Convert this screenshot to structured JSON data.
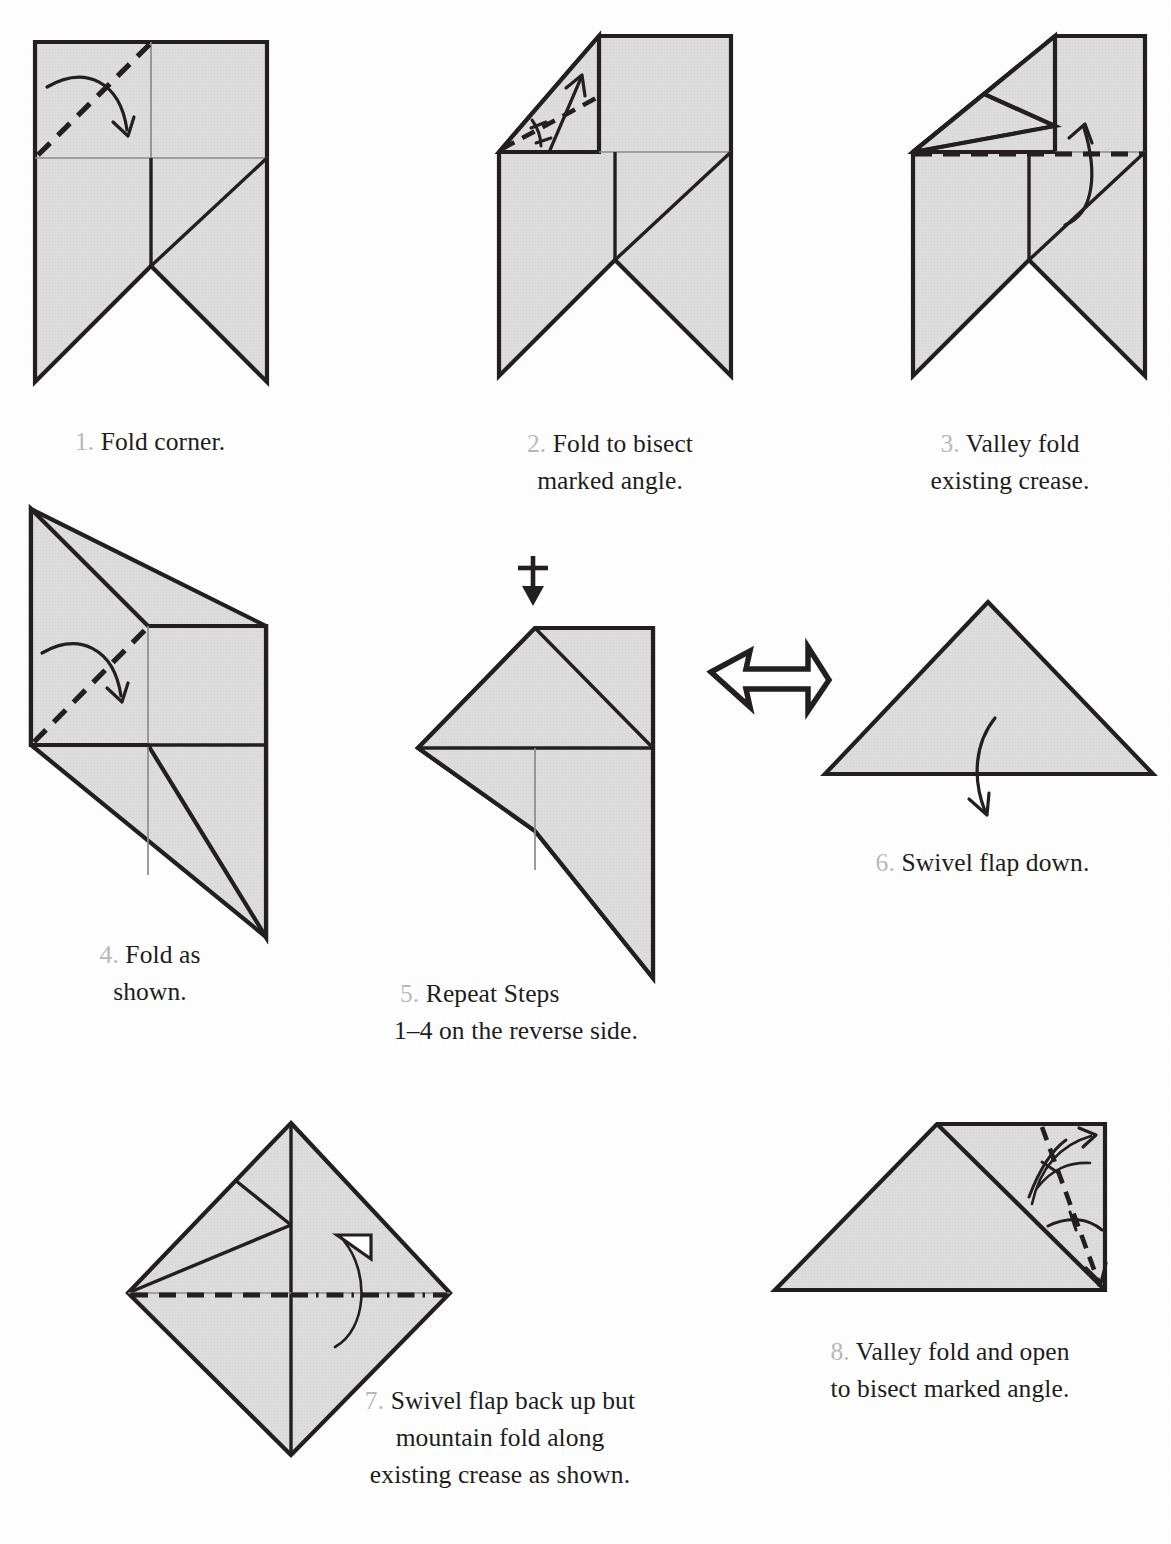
{
  "document": {
    "kind": "origami-folding-instructions",
    "fold_colors": {
      "paper_fill": "#dcdcdc",
      "edge_stroke": "#231f20",
      "crease_gray": "#8c8c8c",
      "step_number_gray": "#b9b9b9"
    }
  },
  "steps": [
    {
      "number": "1.",
      "caption_lines": [
        "Fold corner."
      ],
      "fold_type": "valley",
      "symbols": [
        "curved-fold-arrow",
        "dashed-valley-line"
      ]
    },
    {
      "number": "2.",
      "caption_lines": [
        "Fold to bisect",
        "marked angle."
      ],
      "fold_type": "valley",
      "symbols": [
        "angle-bisector-arc",
        "equal-angle-ticks",
        "straight-fold-arrow",
        "dashed-valley-line"
      ]
    },
    {
      "number": "3.",
      "caption_lines": [
        "Valley fold",
        "existing crease."
      ],
      "fold_type": "valley",
      "symbols": [
        "curved-fold-arrow",
        "dashed-valley-line"
      ]
    },
    {
      "number": "4.",
      "caption_lines": [
        "Fold as",
        "shown."
      ],
      "fold_type": "valley",
      "symbols": [
        "curved-fold-arrow",
        "dashed-valley-line"
      ]
    },
    {
      "number": "5.",
      "caption_lines": [
        "Repeat Steps",
        "1–4  on the reverse side."
      ],
      "fold_type": "turn-over",
      "symbols": [
        "turn-over-arrow"
      ]
    },
    {
      "number": "6.",
      "caption_lines": [
        "Swivel flap down."
      ],
      "fold_type": "swivel",
      "symbols": [
        "curved-fold-arrow"
      ]
    },
    {
      "number": "7.",
      "caption_lines": [
        "Swivel flap back up but",
        "mountain fold along",
        "existing crease as shown."
      ],
      "fold_type": "mountain",
      "symbols": [
        "dashed-valley-line",
        "dash-dot-mountain-line",
        "mountain-fold-arrow"
      ]
    },
    {
      "number": "8.",
      "caption_lines": [
        "Valley fold and open",
        "to bisect marked angle."
      ],
      "fold_type": "valley-and-unfold",
      "symbols": [
        "angle-bisector-arc",
        "equal-angle-ticks",
        "fold-and-unfold-arrow",
        "dashed-valley-line"
      ]
    }
  ],
  "transition": {
    "big_arrow": "hollow-right-arrow",
    "turn_over": "turn-over-symbol"
  }
}
